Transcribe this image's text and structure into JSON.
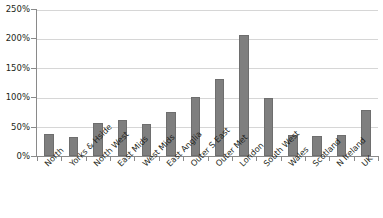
{
  "chart_data": {
    "type": "bar",
    "title": "",
    "subtitle": "",
    "xlabel": "",
    "ylabel": "",
    "ylim": [
      0,
      250
    ],
    "y_tick_labels": [
      "0%",
      "50%",
      "100%",
      "150%",
      "200%",
      "250%"
    ],
    "y_tick_values": [
      0,
      50,
      100,
      150,
      200,
      250
    ],
    "grid": true,
    "legend": false,
    "legend_position": "none",
    "bar_color": "#7f7f7f",
    "categories": [
      "North",
      "Yorks & Hside",
      "North West",
      "East Mids",
      "West Mids",
      "East Anglia",
      "Outer S East",
      "Outer Met",
      "London",
      "South West",
      "Wales",
      "Scotland",
      "N Ireland",
      "UK"
    ],
    "values": [
      38,
      33,
      56,
      61,
      55,
      75,
      101,
      132,
      207,
      100,
      36,
      35,
      36,
      78
    ]
  }
}
